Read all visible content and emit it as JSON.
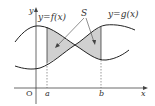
{
  "diagram": {
    "type": "area-between-curves",
    "labels": {
      "y_axis": "y",
      "x_axis": "x",
      "origin": "O",
      "a": "a",
      "b": "b",
      "curve_f": "y=f(x)",
      "curve_g": "y=g(x)",
      "region": "S"
    },
    "colors": {
      "stroke": "#222222",
      "shade": "#d0d0d0",
      "text": "#333333"
    }
  }
}
